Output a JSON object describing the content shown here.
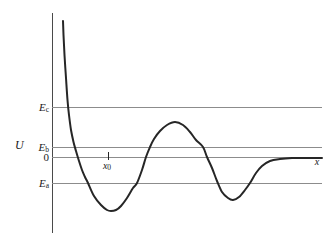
{
  "chart_data": {
    "type": "line",
    "title": "",
    "xlabel": "x",
    "ylabel": "U",
    "x_range": [
      0,
      270
    ],
    "u_range": [
      -76,
      144
    ],
    "grid": "off",
    "legend": "none",
    "colors": {
      "curve": "#262626",
      "level_lines": "#8c8c8c",
      "axis": "#4a4a4a",
      "background": "#ffffff",
      "text": "#1a1a1a"
    },
    "reference_levels": [
      {
        "main": "E",
        "sub": "c",
        "u": 50,
        "italic": true
      },
      {
        "main": "E",
        "sub": "b",
        "u": 10,
        "italic": true
      },
      {
        "main": "0",
        "sub": "",
        "u": 0,
        "italic": false
      },
      {
        "main": "E",
        "sub": "a",
        "u": -26,
        "italic": true
      }
    ],
    "annotations": [
      {
        "main": "x",
        "sub": "0",
        "x": 56,
        "tick_u_top": 5,
        "tick_u_bottom": -3,
        "label_u": -9
      }
    ],
    "series": [
      {
        "name": "potential-energy-curve",
        "points": [
          [
            11,
            136
          ],
          [
            11.5,
            122
          ],
          [
            12.5,
            102
          ],
          [
            14,
            79
          ],
          [
            15.5,
            57
          ],
          [
            17,
            42
          ],
          [
            19,
            27
          ],
          [
            21.5,
            15
          ],
          [
            24,
            6
          ],
          [
            27,
            -4
          ],
          [
            30,
            -13
          ],
          [
            33,
            -20
          ],
          [
            36,
            -26
          ],
          [
            42,
            -39
          ],
          [
            49,
            -48
          ],
          [
            55,
            -53
          ],
          [
            59,
            -54
          ],
          [
            64,
            -53
          ],
          [
            69,
            -49
          ],
          [
            75,
            -41
          ],
          [
            81,
            -31
          ],
          [
            85,
            -26
          ],
          [
            90,
            -13
          ],
          [
            94,
            0
          ],
          [
            98,
            10
          ],
          [
            102,
            18
          ],
          [
            108,
            26
          ],
          [
            115,
            32
          ],
          [
            123,
            35
          ],
          [
            131,
            32
          ],
          [
            138,
            25
          ],
          [
            144,
            17
          ],
          [
            151,
            10
          ],
          [
            155,
            0
          ],
          [
            160,
            -11
          ],
          [
            165,
            -24
          ],
          [
            170,
            -35
          ],
          [
            176,
            -41
          ],
          [
            181,
            -43
          ],
          [
            187,
            -40
          ],
          [
            193,
            -33
          ],
          [
            198,
            -26
          ],
          [
            204,
            -16
          ],
          [
            210,
            -9
          ],
          [
            218,
            -4
          ],
          [
            228,
            -2
          ],
          [
            240,
            -1
          ],
          [
            254,
            -1
          ],
          [
            270,
            -1
          ]
        ]
      }
    ]
  }
}
